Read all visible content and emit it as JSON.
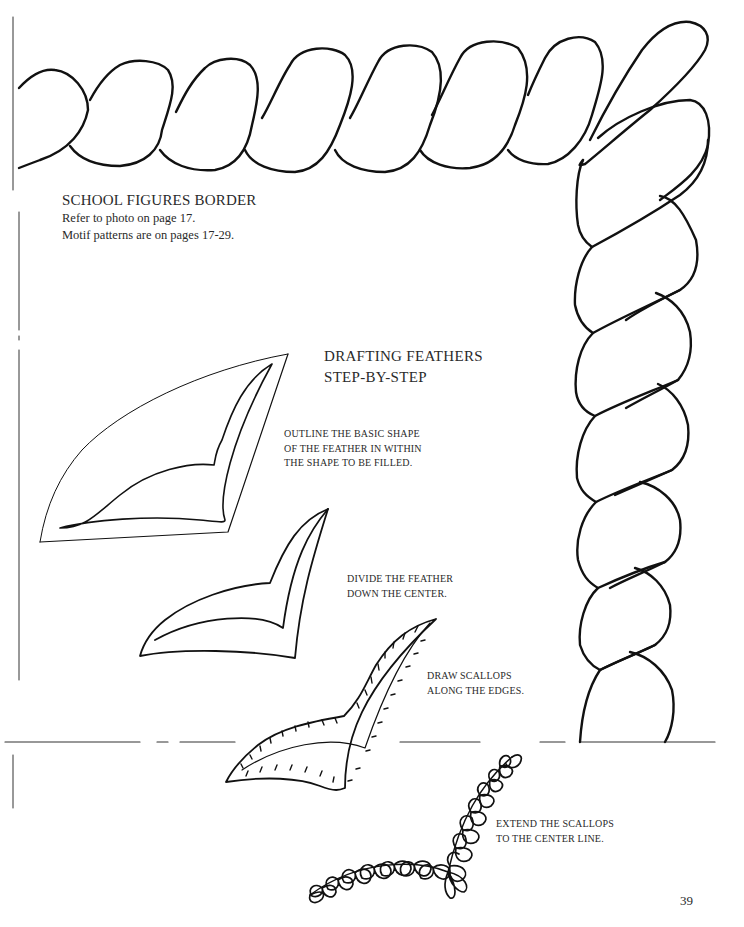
{
  "page": {
    "border_title": "SCHOOL FIGURES BORDER",
    "border_notes": [
      "Refer to photo on page 17.",
      "Motif patterns are on pages 17-29."
    ],
    "section_title": [
      "DRAFTING FEATHERS",
      "STEP-BY-STEP"
    ],
    "steps": [
      {
        "lines": [
          "OUTLINE THE BASIC SHAPE",
          "OF THE FEATHER IN WITHIN",
          "THE SHAPE TO BE FILLED."
        ]
      },
      {
        "lines": [
          "DIVIDE THE FEATHER",
          "DOWN THE CENTER."
        ]
      },
      {
        "lines": [
          "DRAW SCALLOPS",
          "ALONG THE EDGES."
        ]
      },
      {
        "lines": [
          "EXTEND THE SCALLOPS",
          "TO THE CENTER LINE."
        ]
      }
    ],
    "page_number": "39"
  },
  "colors": {
    "ink": "#111111",
    "text": "#2a2a2a",
    "background": "#ffffff"
  }
}
